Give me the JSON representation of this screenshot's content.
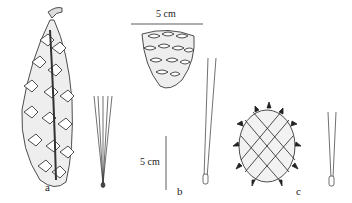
{
  "figure": {
    "panels": [
      {
        "label": "a",
        "cone_shape": "elongated-cylindrical",
        "needles_per_fascicle": 5
      },
      {
        "label": "b",
        "cone_shape": "ovoid",
        "needles_per_fascicle": 2
      },
      {
        "label": "c",
        "cone_shape": "globose-spiny",
        "needles_per_fascicle": 2
      }
    ],
    "scale_bars": [
      {
        "text": "5 cm",
        "orientation": "horizontal"
      },
      {
        "text": "5 cm",
        "orientation": "vertical"
      }
    ],
    "colors": {
      "ink": "#222222",
      "background": "#ffffff"
    }
  }
}
